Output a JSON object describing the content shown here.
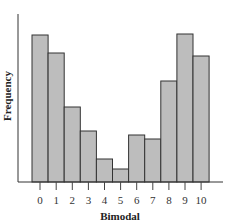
{
  "chart_data": {
    "type": "bar",
    "title": "",
    "xlabel": "Bimodal",
    "ylabel": "Frequency",
    "categories": [
      "0",
      "1",
      "2",
      "3",
      "4",
      "5",
      "6",
      "7",
      "8",
      "9",
      "10"
    ],
    "values": [
      147,
      129,
      75,
      51,
      23,
      13,
      47,
      43,
      101,
      148,
      126
    ],
    "value_units": "relative (no y-axis scale shown)",
    "ylim": [
      0,
      168
    ],
    "grid": false,
    "legend": null,
    "bar_color": "#bdbdbd",
    "edge_color": "#333333"
  },
  "layout": {
    "plot_left": 18,
    "plot_top": 14,
    "baseline_y": 182,
    "axis_right": 223,
    "bars_left": 32,
    "bar_width": 16.1,
    "tick_length": 8,
    "tick_label_y": 200
  }
}
